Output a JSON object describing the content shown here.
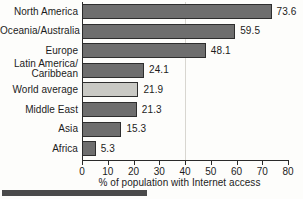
{
  "chart_data": {
    "type": "bar",
    "orientation": "horizontal",
    "title": "",
    "xlabel": "% of population with Internet access",
    "ylabel": "",
    "xlim": [
      0,
      80
    ],
    "xticks": [
      0,
      10,
      20,
      30,
      40,
      50,
      60,
      70,
      80
    ],
    "grid": "single vertical rule at x=40",
    "legend": "none",
    "categories": [
      "North America",
      "Oceania/Australia",
      "Europe",
      "Latin America/\nCaribbean",
      "World average",
      "Middle East",
      "Asia",
      "Africa"
    ],
    "values": [
      73.6,
      59.5,
      48.1,
      24.1,
      21.9,
      21.3,
      15.3,
      5.3
    ],
    "value_labels": [
      "73.6",
      "59.5",
      "48.1",
      "24.1",
      "21.9",
      "21.3",
      "15.3",
      "5.3"
    ],
    "highlight_category": "World average",
    "colors": {
      "bar": "#6e6e6e",
      "bar_highlight": "#c9c9c4",
      "bar_border": "#2e2e2e",
      "axis": "#2a2a2a",
      "grid_line": "#d8d6d0",
      "text": "#1c1c1c",
      "background": "#fdfdfb",
      "caption_rule": "#4a4a4a"
    },
    "bars": [
      {
        "label_line1": "North America",
        "label_line2": "",
        "value": 73.6,
        "value_label": "73.6",
        "highlight": false
      },
      {
        "label_line1": "Oceania/Australia",
        "label_line2": "",
        "value": 59.5,
        "value_label": "59.5",
        "highlight": false
      },
      {
        "label_line1": "Europe",
        "label_line2": "",
        "value": 48.1,
        "value_label": "48.1",
        "highlight": false
      },
      {
        "label_line1": "Latin America/",
        "label_line2": "Caribbean",
        "value": 24.1,
        "value_label": "24.1",
        "highlight": false
      },
      {
        "label_line1": "World average",
        "label_line2": "",
        "value": 21.9,
        "value_label": "21.9",
        "highlight": true
      },
      {
        "label_line1": "Middle East",
        "label_line2": "",
        "value": 21.3,
        "value_label": "21.3",
        "highlight": false
      },
      {
        "label_line1": "Asia",
        "label_line2": "",
        "value": 15.3,
        "value_label": "15.3",
        "highlight": false
      },
      {
        "label_line1": "Africa",
        "label_line2": "",
        "value": 5.3,
        "value_label": "5.3",
        "highlight": false
      }
    ]
  }
}
